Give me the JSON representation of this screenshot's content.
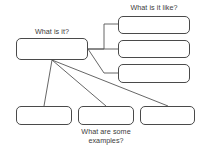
{
  "diagram": {
    "type": "concept-map",
    "background_color": "#ffffff",
    "box_border_color": "#4a4a4a",
    "line_color": "#555555",
    "text_color": "#3b3b3b",
    "captions": {
      "main": "What is it?",
      "attributes": "What is it like?",
      "examples": "What are some\nexamples?"
    },
    "nodes": {
      "main": {
        "label": "",
        "x": 16,
        "y": 38,
        "w": 72,
        "h": 22
      },
      "attributes": [
        {
          "label": "",
          "x": 118,
          "y": 16,
          "w": 72,
          "h": 18
        },
        {
          "label": "",
          "x": 118,
          "y": 40,
          "w": 72,
          "h": 18
        },
        {
          "label": "",
          "x": 118,
          "y": 64,
          "w": 72,
          "h": 19
        }
      ],
      "examples": [
        {
          "label": "",
          "x": 16,
          "y": 106,
          "w": 56,
          "h": 19
        },
        {
          "label": "",
          "x": 78,
          "y": 106,
          "w": 56,
          "h": 19
        },
        {
          "label": "",
          "x": 140,
          "y": 106,
          "w": 55,
          "h": 19
        }
      ]
    },
    "connectors": [
      {
        "from": "main",
        "to": "attribute-1",
        "path": "M88,49 L104,49 L104,24 L118,24"
      },
      {
        "from": "main",
        "to": "attribute-2",
        "path": "M88,49 L118,49"
      },
      {
        "from": "main",
        "to": "attribute-3",
        "path": "M88,49 L104,73 L118,73"
      },
      {
        "from": "main",
        "to": "example-1",
        "path": "M52,60 L44,106"
      },
      {
        "from": "main",
        "to": "example-2",
        "path": "M52,60 L106,106"
      },
      {
        "from": "main",
        "to": "example-3",
        "path": "M52,60 L168,106"
      }
    ]
  }
}
